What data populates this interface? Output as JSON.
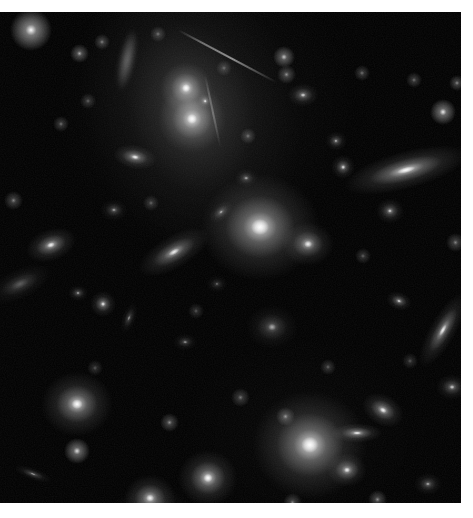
{
  "page": {
    "width": 473,
    "height": 518,
    "background_color": "#ffffff"
  },
  "plate": {
    "name": "galaxy-cluster-field",
    "x": 0,
    "y": 12,
    "width": 461,
    "height": 491,
    "background_color": "#000000",
    "caption": ""
  },
  "chart_data": {
    "type": "scatter",
    "xlabel": "",
    "ylabel": "",
    "xlim": [
      0,
      461
    ],
    "ylim": [
      0,
      491
    ],
    "grid": false,
    "legend": "none",
    "note": "Monochrome astronomical exposure: positions are image-plane pixel coordinates relative to the black plate; brightness is relative peak intensity 0-1; size_px is approximate major-axis extent; angle_deg is position angle of the major axis measured clockwise from horizontal.",
    "background_glow": [
      {
        "name": "intracluster-light",
        "x": 205,
        "y": 95,
        "rx": 150,
        "ry": 150,
        "brightness": 0.1
      },
      {
        "name": "diffuse-halo-lower",
        "x": 300,
        "y": 420,
        "rx": 120,
        "ry": 100,
        "brightness": 0.06
      }
    ],
    "objects": [
      {
        "id": "g01",
        "type": "elliptical",
        "label": "cD-nucleus-north",
        "x": 186,
        "y": 76,
        "size_px": 26,
        "axis_ratio": 1.0,
        "angle_deg": 0,
        "brightness": 1.0
      },
      {
        "id": "g02",
        "type": "elliptical",
        "label": "cD-nucleus-south",
        "x": 192,
        "y": 107,
        "size_px": 34,
        "axis_ratio": 1.0,
        "angle_deg": 0,
        "brightness": 1.0
      },
      {
        "id": "g03",
        "type": "diffuse-halo",
        "label": "cD-common-envelope",
        "x": 190,
        "y": 95,
        "size_px": 150,
        "axis_ratio": 0.72,
        "angle_deg": 75,
        "brightness": 0.3
      },
      {
        "id": "g04",
        "type": "star",
        "label": "point-source-between-nuclei",
        "x": 205,
        "y": 89,
        "size_px": 7,
        "axis_ratio": 1.0,
        "angle_deg": 0,
        "brightness": 0.75
      },
      {
        "id": "g05",
        "type": "elliptical",
        "label": "galaxy-west-of-cd",
        "x": 135,
        "y": 145,
        "size_px": 22,
        "axis_ratio": 0.55,
        "angle_deg": 10,
        "brightness": 0.85
      },
      {
        "id": "g06",
        "type": "elliptical",
        "label": "central-bright-elliptical",
        "x": 260,
        "y": 215,
        "size_px": 60,
        "axis_ratio": 0.9,
        "angle_deg": 0,
        "brightness": 1.0
      },
      {
        "id": "g07",
        "type": "elliptical",
        "label": "companion-east-of-central",
        "x": 308,
        "y": 232,
        "size_px": 26,
        "axis_ratio": 0.85,
        "angle_deg": 0,
        "brightness": 0.8
      },
      {
        "id": "g08",
        "type": "lenticular-edge-on",
        "label": "edge-on-lenticular-east",
        "x": 406,
        "y": 158,
        "size_px": 64,
        "axis_ratio": 0.3,
        "angle_deg": 165,
        "brightness": 0.95
      },
      {
        "id": "g09",
        "type": "elliptical",
        "label": "galaxy-left-of-lenticular",
        "x": 343,
        "y": 155,
        "size_px": 12,
        "axis_ratio": 1.0,
        "angle_deg": 0,
        "brightness": 0.7
      },
      {
        "id": "g10",
        "type": "elliptical",
        "label": "spheroid-below-lenticular",
        "x": 390,
        "y": 199,
        "size_px": 14,
        "axis_ratio": 0.9,
        "angle_deg": 0,
        "brightness": 0.65
      },
      {
        "id": "g11",
        "type": "spiral-inclined",
        "label": "inclined-disk-west",
        "x": 174,
        "y": 240,
        "size_px": 40,
        "axis_ratio": 0.42,
        "angle_deg": 150,
        "brightness": 0.8
      },
      {
        "id": "g12",
        "type": "elliptical",
        "label": "bright-knot-west",
        "x": 51,
        "y": 233,
        "size_px": 26,
        "axis_ratio": 0.62,
        "angle_deg": 160,
        "brightness": 0.85
      },
      {
        "id": "g13",
        "type": "irregular",
        "label": "disturbed-irregular-left-edge",
        "x": 20,
        "y": 272,
        "size_px": 34,
        "axis_ratio": 0.45,
        "angle_deg": 155,
        "brightness": 0.42
      },
      {
        "id": "g14",
        "type": "elliptical",
        "label": "small-galaxy-mid-left",
        "x": 78,
        "y": 281,
        "size_px": 10,
        "axis_ratio": 0.8,
        "angle_deg": 0,
        "brightness": 0.5
      },
      {
        "id": "g15",
        "type": "elliptical",
        "label": "point-galaxy-below-disk",
        "x": 103,
        "y": 292,
        "size_px": 13,
        "axis_ratio": 1.0,
        "angle_deg": 0,
        "brightness": 0.8
      },
      {
        "id": "g16",
        "type": "elliptical",
        "label": "faint-elongated-center-left",
        "x": 129,
        "y": 306,
        "size_px": 16,
        "axis_ratio": 0.45,
        "angle_deg": 110,
        "brightness": 0.4
      },
      {
        "id": "g17",
        "type": "elliptical",
        "label": "diffuse-spheroid-center",
        "x": 272,
        "y": 315,
        "size_px": 26,
        "axis_ratio": 0.85,
        "angle_deg": 0,
        "brightness": 0.45
      },
      {
        "id": "g18",
        "type": "lenticular-edge-on",
        "label": "edge-on-disk-east",
        "x": 443,
        "y": 318,
        "size_px": 42,
        "axis_ratio": 0.32,
        "angle_deg": 120,
        "brightness": 0.8
      },
      {
        "id": "g19",
        "type": "elliptical",
        "label": "bright-elliptical-lower-left",
        "x": 77,
        "y": 392,
        "size_px": 36,
        "axis_ratio": 0.9,
        "angle_deg": 0,
        "brightness": 0.95
      },
      {
        "id": "g20",
        "type": "elliptical",
        "label": "large-elliptical-lower-right",
        "x": 310,
        "y": 433,
        "size_px": 58,
        "axis_ratio": 0.95,
        "angle_deg": 0,
        "brightness": 1.0
      },
      {
        "id": "g21",
        "type": "lenticular-edge-on",
        "label": "edge-on-bar-right-of-elliptical",
        "x": 357,
        "y": 421,
        "size_px": 26,
        "axis_ratio": 0.38,
        "angle_deg": 0,
        "brightness": 0.85
      },
      {
        "id": "g22",
        "type": "elliptical",
        "label": "galaxy-below-bar",
        "x": 347,
        "y": 458,
        "size_px": 20,
        "axis_ratio": 0.85,
        "angle_deg": 0,
        "brightness": 0.8
      },
      {
        "id": "g23",
        "type": "elliptical",
        "label": "galaxy-upper-right-of-elliptical",
        "x": 383,
        "y": 398,
        "size_px": 22,
        "axis_ratio": 0.7,
        "angle_deg": 30,
        "brightness": 0.85
      },
      {
        "id": "g24",
        "type": "elliptical",
        "label": "bright-galaxy-bottom-center",
        "x": 208,
        "y": 466,
        "size_px": 30,
        "axis_ratio": 0.95,
        "angle_deg": 0,
        "brightness": 0.95
      },
      {
        "id": "g25",
        "type": "elliptical",
        "label": "galaxy-bottom-left-of-center",
        "x": 150,
        "y": 486,
        "size_px": 26,
        "axis_ratio": 0.9,
        "angle_deg": 0,
        "brightness": 0.85
      },
      {
        "id": "g26",
        "type": "elliptical",
        "label": "diffuse-object-bottom",
        "x": 152,
        "y": 498,
        "size_px": 40,
        "axis_ratio": 0.6,
        "angle_deg": 0,
        "brightness": 0.3
      },
      {
        "id": "g27",
        "type": "elliptical",
        "label": "galaxy-far-right-mid",
        "x": 452,
        "y": 375,
        "size_px": 16,
        "axis_ratio": 0.8,
        "angle_deg": 0,
        "brightness": 0.6
      },
      {
        "id": "g28",
        "type": "elliptical",
        "label": "compact-knot-right",
        "x": 399,
        "y": 289,
        "size_px": 13,
        "axis_ratio": 0.7,
        "angle_deg": 20,
        "brightness": 0.7
      },
      {
        "id": "g29",
        "type": "elliptical",
        "label": "small-galaxy-right-upper",
        "x": 303,
        "y": 83,
        "size_px": 16,
        "axis_ratio": 0.75,
        "angle_deg": 0,
        "brightness": 0.65
      },
      {
        "id": "g30",
        "type": "elliptical",
        "label": "galaxy-top-right-quadrant",
        "x": 336,
        "y": 129,
        "size_px": 11,
        "axis_ratio": 0.9,
        "angle_deg": 0,
        "brightness": 0.55
      },
      {
        "id": "g31",
        "type": "elliptical",
        "label": "faint-galaxy-upper-mid",
        "x": 246,
        "y": 166,
        "size_px": 12,
        "axis_ratio": 0.8,
        "angle_deg": 0,
        "brightness": 0.45
      },
      {
        "id": "g32",
        "type": "elliptical",
        "label": "galaxy-left-of-central",
        "x": 221,
        "y": 200,
        "size_px": 14,
        "axis_ratio": 0.6,
        "angle_deg": 140,
        "brightness": 0.5
      },
      {
        "id": "g33",
        "type": "elliptical",
        "label": "faint-spheroid-mid",
        "x": 217,
        "y": 272,
        "size_px": 11,
        "axis_ratio": 0.8,
        "angle_deg": 0,
        "brightness": 0.3
      },
      {
        "id": "g34",
        "type": "elliptical",
        "label": "galaxy-lower-mid-left",
        "x": 185,
        "y": 330,
        "size_px": 12,
        "axis_ratio": 0.7,
        "angle_deg": 0,
        "brightness": 0.4
      },
      {
        "id": "g35",
        "type": "elliptical",
        "label": "faint-edge-on-lower-left",
        "x": 33,
        "y": 462,
        "size_px": 20,
        "axis_ratio": 0.3,
        "angle_deg": 20,
        "brightness": 0.45
      },
      {
        "id": "g36",
        "type": "elliptical",
        "label": "galaxy-bottom-right-corner",
        "x": 428,
        "y": 472,
        "size_px": 14,
        "axis_ratio": 0.8,
        "angle_deg": 0,
        "brightness": 0.5
      },
      {
        "id": "g37",
        "type": "elliptical",
        "label": "galaxy-below-cd-west",
        "x": 114,
        "y": 198,
        "size_px": 14,
        "axis_ratio": 0.8,
        "angle_deg": 0,
        "brightness": 0.45
      }
    ],
    "stars": [
      {
        "id": "s01",
        "x": 31,
        "y": 18,
        "size_px": 11,
        "brightness": 1.0
      },
      {
        "id": "s02",
        "x": 79,
        "y": 41,
        "size_px": 5,
        "brightness": 0.6
      },
      {
        "id": "s03",
        "x": 102,
        "y": 30,
        "size_px": 4,
        "brightness": 0.45
      },
      {
        "id": "s04",
        "x": 284,
        "y": 45,
        "size_px": 6,
        "brightness": 0.7
      },
      {
        "id": "s05",
        "x": 286,
        "y": 62,
        "size_px": 5,
        "brightness": 0.5
      },
      {
        "id": "s06",
        "x": 443,
        "y": 100,
        "size_px": 7,
        "brightness": 0.85
      },
      {
        "id": "s07",
        "x": 457,
        "y": 71,
        "size_px": 4,
        "brightness": 0.5
      },
      {
        "id": "s08",
        "x": 362,
        "y": 61,
        "size_px": 4,
        "brightness": 0.4
      },
      {
        "id": "s09",
        "x": 414,
        "y": 68,
        "size_px": 4,
        "brightness": 0.4
      },
      {
        "id": "s10",
        "x": 158,
        "y": 22,
        "size_px": 4,
        "brightness": 0.4
      },
      {
        "id": "s11",
        "x": 61,
        "y": 112,
        "size_px": 4,
        "brightness": 0.4
      },
      {
        "id": "s12",
        "x": 88,
        "y": 89,
        "size_px": 4,
        "brightness": 0.35
      },
      {
        "id": "s13",
        "x": 13,
        "y": 188,
        "size_px": 5,
        "brightness": 0.45
      },
      {
        "id": "s14",
        "x": 151,
        "y": 191,
        "size_px": 4,
        "brightness": 0.35
      },
      {
        "id": "s15",
        "x": 248,
        "y": 124,
        "size_px": 4,
        "brightness": 0.4
      },
      {
        "id": "s16",
        "x": 363,
        "y": 244,
        "size_px": 4,
        "brightness": 0.35
      },
      {
        "id": "s17",
        "x": 455,
        "y": 230,
        "size_px": 5,
        "brightness": 0.45
      },
      {
        "id": "s18",
        "x": 240,
        "y": 385,
        "size_px": 5,
        "brightness": 0.4
      },
      {
        "id": "s19",
        "x": 77,
        "y": 439,
        "size_px": 7,
        "brightness": 0.8
      },
      {
        "id": "s20",
        "x": 169,
        "y": 410,
        "size_px": 5,
        "brightness": 0.5
      },
      {
        "id": "s21",
        "x": 292,
        "y": 490,
        "size_px": 5,
        "brightness": 0.45
      },
      {
        "id": "s22",
        "x": 377,
        "y": 487,
        "size_px": 5,
        "brightness": 0.5
      },
      {
        "id": "s23",
        "x": 196,
        "y": 299,
        "size_px": 4,
        "brightness": 0.3
      },
      {
        "id": "s24",
        "x": 328,
        "y": 355,
        "size_px": 4,
        "brightness": 0.35
      },
      {
        "id": "s25",
        "x": 95,
        "y": 356,
        "size_px": 4,
        "brightness": 0.3
      },
      {
        "id": "s26",
        "x": 285,
        "y": 404,
        "size_px": 5,
        "brightness": 0.5
      },
      {
        "id": "s27",
        "x": 224,
        "y": 56,
        "size_px": 4,
        "brightness": 0.35
      },
      {
        "id": "s28",
        "x": 410,
        "y": 349,
        "size_px": 4,
        "brightness": 0.3
      }
    ],
    "streaks": [
      {
        "id": "t01",
        "label": "satellite-trail",
        "x": 178,
        "y": 17,
        "length_px": 112,
        "thickness_px": 2,
        "angle_deg": 28,
        "brightness": 0.7
      },
      {
        "id": "t02",
        "label": "tidal-arc",
        "x": 205,
        "y": 62,
        "length_px": 74,
        "thickness_px": 2,
        "angle_deg": 78,
        "brightness": 0.35
      }
    ],
    "wisps": [
      {
        "id": "w01",
        "label": "tidal-filament",
        "x": 127,
        "y": 48,
        "rx": 8,
        "ry": 32,
        "angle_deg": 12,
        "brightness": 0.4
      }
    ]
  }
}
